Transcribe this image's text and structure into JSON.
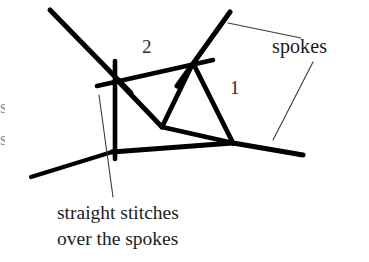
{
  "figure": {
    "background_color": "#ffffff",
    "ink_color": "#000000",
    "thin_line_color": "#3a3a3a",
    "width": 369,
    "height": 262
  },
  "labels": {
    "spokes": "spokes",
    "number_two": "2",
    "number_one": "1"
  },
  "caption": {
    "line1": "straight stitches",
    "line2": "over the spokes"
  },
  "cropped_text": {
    "fragment_top": "s",
    "fragment_bottom": "s"
  },
  "diagram_data": {
    "type": "line-drawing",
    "description": "Hand-drawn embroidery diagram showing crossing spokes with straight stitches worked over them",
    "nodes": [
      {
        "name": "left-spoke-node",
        "x": 113,
        "y": 77
      },
      {
        "name": "right-spoke-node",
        "x": 192,
        "y": 62
      },
      {
        "name": "center-junction",
        "x": 162,
        "y": 127
      },
      {
        "name": "lower-right-node",
        "x": 233,
        "y": 143
      },
      {
        "name": "lower-left-crossing",
        "x": 112,
        "y": 152
      }
    ],
    "spokes": [
      {
        "name": "upper-left-spoke",
        "from": [
          50,
          10
        ],
        "to": [
          130,
          92
        ]
      },
      {
        "name": "upper-right-spoke",
        "from": [
          230,
          12
        ],
        "to": [
          178,
          85
        ]
      },
      {
        "name": "lower-long-spoke",
        "from": [
          31,
          177
        ],
        "to": [
          303,
          155
        ]
      }
    ],
    "stitches": [
      {
        "name": "top-horizontal-stitch",
        "from": [
          97,
          85
        ],
        "to": [
          213,
          60
        ]
      },
      {
        "name": "left-vertical-stitch",
        "from": [
          115,
          62
        ],
        "to": [
          115,
          158
        ]
      },
      {
        "name": "left-to-center-stitch",
        "from": [
          118,
          80
        ],
        "to": [
          162,
          127
        ]
      },
      {
        "name": "right-to-center-stitch",
        "from": [
          192,
          66
        ],
        "to": [
          162,
          127
        ]
      },
      {
        "name": "center-to-lower-right-stitch",
        "from": [
          162,
          127
        ],
        "to": [
          233,
          143
        ]
      },
      {
        "name": "right-node-descender-stitch",
        "from": [
          194,
          66
        ],
        "to": [
          233,
          143
        ]
      }
    ],
    "leaders": [
      {
        "name": "spokes-leader-upper",
        "from": [
          228,
          23
        ],
        "to": [
          301,
          38
        ]
      },
      {
        "name": "spokes-leader-lower",
        "from": [
          313,
          62
        ],
        "to": [
          273,
          140
        ]
      },
      {
        "name": "stitches-caption-leader",
        "from": [
          99,
          95
        ],
        "to": [
          113,
          197
        ]
      }
    ]
  }
}
